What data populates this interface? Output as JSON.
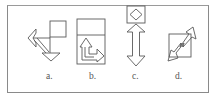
{
  "figure": {
    "type": "spatial-reasoning-options",
    "options": [
      {
        "id": "a",
        "label": "a.",
        "description": "Square with left-pointing arrow head and down-pointing triangle joined by diagonal and orthogonal lines"
      },
      {
        "id": "b",
        "label": "b.",
        "description": "Tall rectangle with horizontal divider containing an L-shaped arrow pointing up and right"
      },
      {
        "id": "c",
        "label": "c.",
        "description": "Small square containing a diamond above a vertical double-headed arrow"
      },
      {
        "id": "d",
        "label": "d.",
        "description": "Square overlapped by a diagonal double-headed zigzag arrow"
      }
    ]
  },
  "colors": {
    "stroke": "#555555",
    "frame": "#8a8a8a",
    "label": "#555555",
    "background": "#ffffff"
  }
}
